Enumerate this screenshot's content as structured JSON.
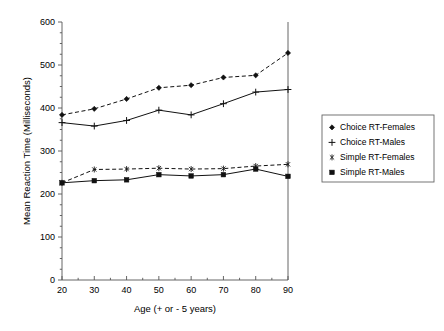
{
  "chart_data": {
    "type": "line",
    "title": "",
    "xlabel": "Age (+ or - 5 years)",
    "ylabel": "Mean Reaction Time (Milliseconds)",
    "x": [
      20,
      30,
      40,
      50,
      60,
      70,
      80,
      90
    ],
    "xtick_labels": [
      "20",
      "30",
      "40",
      "50",
      "60",
      "70",
      "80",
      "90"
    ],
    "ytick_labels": [
      "0",
      "100",
      "200",
      "300",
      "400",
      "500",
      "600"
    ],
    "yticks": [
      0,
      100,
      200,
      300,
      400,
      500,
      600
    ],
    "xlim": [
      20,
      90
    ],
    "ylim": [
      0,
      600
    ],
    "grid": false,
    "legend_position": "right",
    "series": [
      {
        "name": "Choice RT-Females",
        "values": [
          384,
          398,
          421,
          447,
          453,
          471,
          476,
          528
        ],
        "line_style": "dashed",
        "marker": "diamond",
        "color": "#111111"
      },
      {
        "name": "Choice RT-Males",
        "values": [
          366,
          358,
          371,
          395,
          384,
          410,
          437,
          443
        ],
        "line_style": "solid",
        "marker": "plus",
        "color": "#111111"
      },
      {
        "name": "Simple RT-Females",
        "values": [
          226,
          257,
          258,
          260,
          258,
          259,
          265,
          269
        ],
        "line_style": "dashed",
        "marker": "asterisk",
        "color": "#111111"
      },
      {
        "name": "Simple RT-Males",
        "values": [
          226,
          231,
          233,
          245,
          242,
          245,
          258,
          241
        ],
        "line_style": "solid",
        "marker": "square",
        "color": "#111111"
      }
    ]
  },
  "legend": {
    "entries": [
      {
        "label": "Choice RT-Females",
        "marker": "diamond"
      },
      {
        "label": "Choice RT-Males",
        "marker": "plus"
      },
      {
        "label": "Simple RT-Females",
        "marker": "asterisk"
      },
      {
        "label": "Simple RT-Males",
        "marker": "square"
      }
    ]
  },
  "colors": {
    "background": "#ffffff",
    "axis": "#555555",
    "ink": "#111111",
    "legend_border": "#666666"
  }
}
